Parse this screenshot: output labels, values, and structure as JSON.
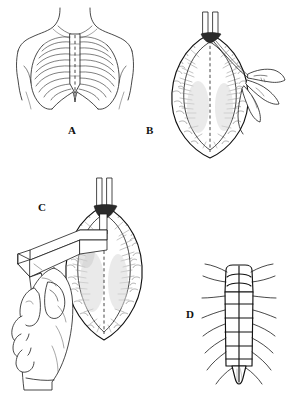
{
  "figure": {
    "panel_count": 4,
    "background_color": "#ffffff",
    "ink_color": "#1a1a1a",
    "style": "black-and-white pen-and-ink medical line drawing"
  },
  "panels": [
    {
      "id": "A",
      "label": "A",
      "label_x": 72,
      "label_y": 131,
      "caption": "Anterior chest wall showing rib cage, sternum and dashed midline incision line",
      "features": {
        "rib_pairs": 10,
        "incision_line": "dashed vertical midline over sternum",
        "landmarks": [
          "neck",
          "clavicles",
          "shoulders",
          "manubrium",
          "sternal body",
          "xiphoid process",
          "costal margin"
        ]
      }
    },
    {
      "id": "B",
      "label": "B",
      "label_x": 150,
      "label_y": 131,
      "caption": "Opened wound retracted; surgeon's hand guides instrument along the dashed midline",
      "features": {
        "wound_shape": "lens / almond shaped open incision",
        "midline": "dashed vertical line",
        "hand": "right hand holding thin instrument entering from the right",
        "top_notch": "dark suprasternal notch between two vertical retractor blades",
        "edge_texture": "stippled subcutaneous fat with radiating striations"
      }
    },
    {
      "id": "C",
      "label": "C",
      "label_x": 42,
      "label_y": 208,
      "caption": "Pistol-grip sternal saw held in the hand, blade dividing the sternum along the midline",
      "features": {
        "instrument": "pneumatic pistol-grip sternal saw",
        "grip": "hand wrapped around handle from below",
        "blade_entry": "dark notch at superior end of wound",
        "midline": "dashed vertical cut line"
      }
    },
    {
      "id": "D",
      "label": "D",
      "label_x": 190,
      "label_y": 315,
      "caption": "Closed sternum with transverse stainless steel wire sutures",
      "features": {
        "curved_wires_manubrium": 2,
        "straight_wires_body": 5,
        "total_wires": 7,
        "rib_pairs": 7,
        "parts": [
          "manubrium",
          "sternal body",
          "xiphoid process",
          "costal cartilages"
        ]
      }
    }
  ]
}
